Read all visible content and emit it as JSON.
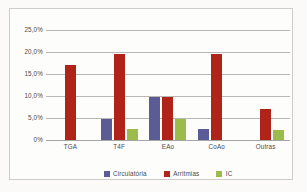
{
  "chart_data": {
    "type": "bar",
    "title": "",
    "xlabel": "",
    "ylabel": "",
    "ylim": [
      0,
      25
    ],
    "grid": true,
    "legend_position": "bottom-center",
    "categories": [
      "TGA",
      "T4F",
      "EAo",
      "CoAo",
      "Outras"
    ],
    "ytick_labels": [
      "25,0%",
      "20,0%",
      "15,0%",
      "10,0%",
      "5,0%",
      "0%"
    ],
    "ytick_values": [
      25,
      20,
      15,
      10,
      5,
      0
    ],
    "series": [
      {
        "name": "Circulatória",
        "color": "#5b5b96",
        "values": [
          null,
          4.8,
          9.8,
          2.4,
          null
        ]
      },
      {
        "name": "Arritmias",
        "color": "#b02318",
        "values": [
          17.0,
          19.5,
          9.7,
          19.5,
          7.0
        ]
      },
      {
        "name": "IC",
        "color": "#9bbb4b",
        "values": [
          null,
          2.4,
          4.8,
          null,
          2.2
        ]
      }
    ]
  }
}
